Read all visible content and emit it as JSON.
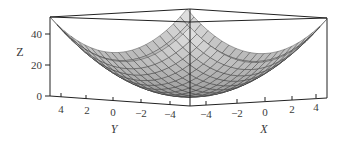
{
  "chart_data": {
    "type": "surface3d",
    "function": "z = x^2 + y^2",
    "title": "",
    "xlabel": "X",
    "ylabel": "Y",
    "zlabel": "Z",
    "x_range": [
      -5,
      5
    ],
    "y_range": [
      -5,
      5
    ],
    "z_range": [
      0,
      50
    ],
    "x_ticks": [
      "-4",
      "-2",
      "0",
      "2",
      "4"
    ],
    "y_ticks": [
      "4",
      "2",
      "0",
      "-2",
      "-4"
    ],
    "z_ticks": [
      "0",
      "20",
      "40"
    ],
    "grid_divisions": 20,
    "surface_color": "#d9d9d9",
    "mesh_color": "#333333",
    "box": true,
    "legend": null
  },
  "labels": {
    "x": "X",
    "y": "Y",
    "z": "Z"
  },
  "ticks": {
    "z": [
      "40",
      "20",
      "0"
    ],
    "y": [
      "4",
      "2",
      "0",
      "−2",
      "−4"
    ],
    "x": [
      "−4",
      "−2",
      "0",
      "2",
      "4"
    ]
  }
}
